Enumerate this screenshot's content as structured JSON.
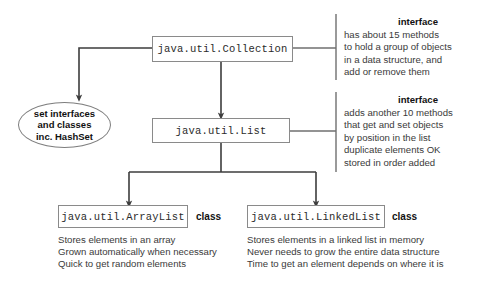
{
  "diagram": {
    "line_color": "#444444",
    "box_border_color": "#8a8a8a",
    "background": "#ffffff"
  },
  "nodes": {
    "collection": {
      "label": "java.util.Collection"
    },
    "list": {
      "label": "java.util.List"
    },
    "arraylist": {
      "label": "java.util.ArrayList",
      "kind": "class"
    },
    "linkedlist": {
      "label": "java.util.LinkedList",
      "kind": "class"
    },
    "set_ellipse": {
      "line1": "set  interfaces",
      "line2": "and classes",
      "line3": "inc. HashSet"
    }
  },
  "annotations": {
    "collection": {
      "heading": "interface",
      "lines": [
        "has about 15 methods",
        "to hold a group of objects",
        "in a data structure, and",
        "add or remove them"
      ]
    },
    "list": {
      "heading": "interface",
      "lines": [
        "adds another 10 methods",
        "that get and set objects",
        "by position in the list",
        "duplicate elements OK",
        "stored in order added"
      ]
    }
  },
  "descriptions": {
    "arraylist": [
      "Stores elements in an array",
      "Grown automatically when necessary",
      "Quick to get random elements"
    ],
    "linkedlist": [
      "Stores elements in a linked list in memory",
      "Never needs to grow the entire data structure",
      "Time to get an element depends on where it is"
    ]
  }
}
